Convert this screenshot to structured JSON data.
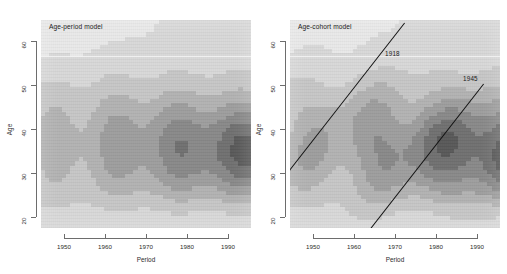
{
  "figure": {
    "width": 507,
    "height": 274,
    "background": "#ffffff",
    "colormap": "grayscale"
  },
  "chart_data": {
    "type": "heatmap",
    "title": "",
    "panels": [
      {
        "id": "age-period",
        "title": "Age-period model",
        "xlabel": "Period",
        "ylabel": "Age",
        "xlim": [
          1945,
          1997
        ],
        "ylim": [
          15,
          65
        ],
        "xticks": [
          1950,
          1960,
          1970,
          1980,
          1990
        ],
        "xticklabels": [
          "1950",
          "1960",
          "1970",
          "1980",
          "1990"
        ],
        "yticks": [
          20,
          30,
          40,
          50,
          60
        ],
        "yticklabels": [
          "20",
          "30",
          "40",
          "50",
          "60"
        ],
        "grid": false,
        "reference_lines": [
          {
            "kind": "horizontal",
            "age": 57,
            "color": "#f2f2f2",
            "label": ""
          }
        ],
        "levels": [
          1,
          2,
          3,
          4,
          5,
          6,
          7,
          8
        ],
        "level_colors": [
          "#e9e9e9",
          "#d8d8d8",
          "#c6c6c6",
          "#b2b2b2",
          "#9d9d9d",
          "#888888",
          "#6f6f6f",
          "#575757"
        ],
        "notes": "Contour bands of rate surface; lightest at bottom (young ages) and top-left, darkest lobes near ages 30-40 in later periods."
      },
      {
        "id": "age-cohort",
        "title": "Age-cohort model",
        "xlabel": "Period",
        "ylabel": "Age",
        "xlim": [
          1945,
          1997
        ],
        "ylim": [
          15,
          65
        ],
        "xticks": [
          1950,
          1960,
          1970,
          1980,
          1990
        ],
        "xticklabels": [
          "1950",
          "1960",
          "1970",
          "1980",
          "1990"
        ],
        "yticks": [
          20,
          30,
          40,
          50,
          60
        ],
        "yticklabels": [
          "20",
          "30",
          "40",
          "50",
          "60"
        ],
        "grid": false,
        "reference_lines": [
          {
            "kind": "horizontal",
            "age": 57,
            "color": "#f2f2f2",
            "label": ""
          },
          {
            "kind": "cohort",
            "cohort": 1918,
            "color": "#111111",
            "label": "1918"
          },
          {
            "kind": "cohort",
            "cohort": 1945,
            "color": "#111111",
            "label": "1945"
          }
        ],
        "levels": [
          1,
          2,
          3,
          4,
          5,
          6,
          7,
          8
        ],
        "level_colors": [
          "#e9e9e9",
          "#d8d8d8",
          "#c6c6c6",
          "#b2b2b2",
          "#9d9d9d",
          "#888888",
          "#6f6f6f",
          "#575757"
        ],
        "notes": "Same surface shown with cohort diagonals for birth cohorts 1918 and 1945 overlaid."
      }
    ]
  }
}
